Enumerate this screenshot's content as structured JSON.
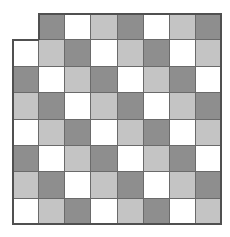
{
  "diagram": {
    "rows": 8,
    "cols": 8,
    "missing_cells": [
      [
        0,
        0
      ]
    ],
    "colors": {
      "D": "#8e8e8e",
      "L": "#c4c4c4",
      "W": "#ffffff"
    },
    "grid": [
      [
        "_",
        "D",
        "W",
        "L",
        "D",
        "W",
        "L",
        "D"
      ],
      [
        "W",
        "L",
        "D",
        "W",
        "L",
        "D",
        "W",
        "L"
      ],
      [
        "D",
        "W",
        "L",
        "D",
        "W",
        "L",
        "D",
        "W"
      ],
      [
        "L",
        "D",
        "W",
        "L",
        "D",
        "W",
        "L",
        "D"
      ],
      [
        "W",
        "L",
        "D",
        "W",
        "L",
        "D",
        "W",
        "L"
      ],
      [
        "D",
        "W",
        "L",
        "D",
        "W",
        "L",
        "D",
        "W"
      ],
      [
        "L",
        "D",
        "W",
        "L",
        "D",
        "W",
        "L",
        "D"
      ],
      [
        "W",
        "L",
        "D",
        "W",
        "L",
        "D",
        "W",
        "L"
      ]
    ]
  }
}
